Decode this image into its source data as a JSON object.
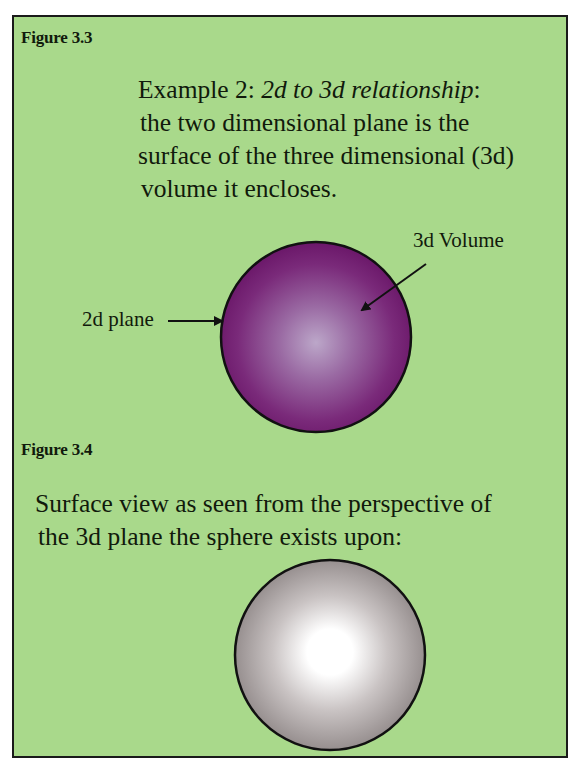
{
  "figure_3_3": {
    "label": "Figure 3.3",
    "caption": {
      "line1_prefix": "Example 2: ",
      "line1_italic": "2d to 3d relationship",
      "line1_suffix": ":",
      "line2": "the two dimensional plane is the",
      "line3": "surface of the three dimensional (3d)",
      "line4": "volume it encloses."
    },
    "diagram": {
      "label_2d": "2d plane",
      "label_3d": "3d Volume",
      "sphere_colors": {
        "center": "#b9a3c6",
        "edge": "#6a1568",
        "outline": "#111111"
      }
    }
  },
  "figure_3_4": {
    "label": "Figure 3.4",
    "caption": {
      "line1": "Surface view as seen from the perspective of",
      "line2": "the 3d plane the sphere exists upon:"
    },
    "diagram": {
      "sphere_colors": {
        "center": "#ffffff",
        "edge": "#8e8585",
        "outline": "#111111"
      }
    }
  },
  "colors": {
    "background": "#a9d98b",
    "border": "#1a1a1a",
    "text": "#111a0c"
  }
}
